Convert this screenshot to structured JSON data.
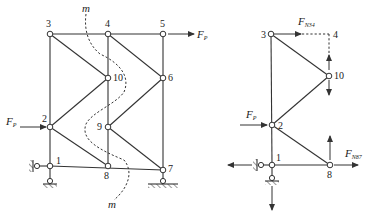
{
  "left_truss": {
    "nodes": [
      {
        "id": "1",
        "x": 50,
        "y": 166
      },
      {
        "id": "2",
        "x": 50,
        "y": 127
      },
      {
        "id": "3",
        "x": 50,
        "y": 34
      },
      {
        "id": "4",
        "x": 108,
        "y": 34
      },
      {
        "id": "5",
        "x": 163,
        "y": 34
      },
      {
        "id": "6",
        "x": 163,
        "y": 78
      },
      {
        "id": "7",
        "x": 163,
        "y": 170
      },
      {
        "id": "8",
        "x": 108,
        "y": 166
      },
      {
        "id": "9",
        "x": 108,
        "y": 127
      },
      {
        "id": "10",
        "x": 108,
        "y": 78
      }
    ],
    "members": [
      [
        "1",
        "2"
      ],
      [
        "2",
        "3"
      ],
      [
        "3",
        "4"
      ],
      [
        "4",
        "5"
      ],
      [
        "5",
        "6"
      ],
      [
        "6",
        "7"
      ],
      [
        "1",
        "8"
      ],
      [
        "8",
        "7"
      ],
      [
        "4",
        "10"
      ],
      [
        "10",
        "9"
      ],
      [
        "9",
        "8"
      ],
      [
        "3",
        "10"
      ],
      [
        "10",
        "2"
      ],
      [
        "2",
        "8"
      ],
      [
        "4",
        "6"
      ],
      [
        "6",
        "9"
      ],
      [
        "9",
        "7"
      ]
    ],
    "loads": {
      "top": {
        "label": "F",
        "sub": "P",
        "at_node": "5",
        "direction": "right"
      },
      "left": {
        "label": "F",
        "sub": "P",
        "at_node": "2",
        "direction": "right"
      }
    },
    "section_cut": {
      "label_top": "m",
      "label_bottom": "m"
    },
    "supports": {
      "node_1": "pin + roller (horizontal & vertical)",
      "node_7": "roller"
    }
  },
  "free_body": {
    "nodes": [
      {
        "id": "3",
        "x": 271,
        "y": 34
      },
      {
        "id": "4",
        "x": 329,
        "y": 34
      },
      {
        "id": "10",
        "x": 329,
        "y": 76
      },
      {
        "id": "2",
        "x": 272,
        "y": 125
      },
      {
        "id": "1",
        "x": 272,
        "y": 165
      },
      {
        "id": "8",
        "x": 330,
        "y": 165
      }
    ],
    "forces": {
      "f34": {
        "label": "F",
        "sub": "N34"
      },
      "f87": {
        "label": "F",
        "sub": "N87"
      },
      "fp": {
        "label": "F",
        "sub": "P"
      }
    }
  },
  "labels": {
    "m": "m",
    "F": "F",
    "P": "P",
    "N34": "N34",
    "N87": "N87",
    "n1": "1",
    "n2": "2",
    "n3": "3",
    "n4": "4",
    "n5": "5",
    "n6": "6",
    "n7": "7",
    "n8": "8",
    "n9": "9",
    "n10": "10"
  }
}
